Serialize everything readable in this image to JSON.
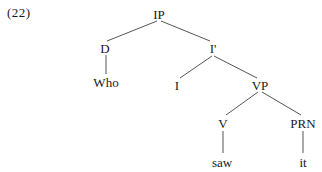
{
  "example_number": "(22)",
  "tree": {
    "nodes": {
      "ip": {
        "label": "IP",
        "x": 159,
        "y": 14
      },
      "d": {
        "label": "D",
        "x": 105,
        "y": 48
      },
      "who": {
        "label": "Who",
        "x": 106,
        "y": 82
      },
      "ibar": {
        "label": "I'",
        "x": 212,
        "y": 48
      },
      "i": {
        "label": "I",
        "x": 177,
        "y": 85
      },
      "vp": {
        "label": "VP",
        "x": 260,
        "y": 85
      },
      "v": {
        "label": "V",
        "x": 223,
        "y": 123
      },
      "prn": {
        "label": "PRN",
        "x": 303,
        "y": 123
      },
      "saw": {
        "label": "saw",
        "x": 222,
        "y": 162
      },
      "it": {
        "label": "it",
        "x": 303,
        "y": 162
      }
    },
    "edges": [
      {
        "from": "ip",
        "to": "d"
      },
      {
        "from": "ip",
        "to": "ibar"
      },
      {
        "from": "d",
        "to": "who"
      },
      {
        "from": "ibar",
        "to": "i"
      },
      {
        "from": "ibar",
        "to": "vp"
      },
      {
        "from": "vp",
        "to": "v"
      },
      {
        "from": "vp",
        "to": "prn"
      },
      {
        "from": "v",
        "to": "saw"
      },
      {
        "from": "prn",
        "to": "it"
      }
    ]
  }
}
